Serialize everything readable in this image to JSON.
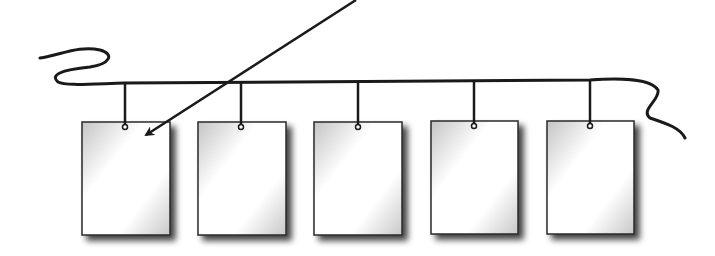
{
  "diagram": {
    "title": "",
    "colors": {
      "background": "#ffffff",
      "line": "#1a1a1a",
      "card_fill_light": "#ffffff",
      "card_fill_dark": "#c8c8c8",
      "shadow": "#555555"
    },
    "cards": [
      {
        "id": "card-1",
        "label": "",
        "x": 82,
        "y": 122,
        "w": 88,
        "h": 113,
        "hook_x": 125
      },
      {
        "id": "card-2",
        "label": "",
        "x": 198,
        "y": 122,
        "w": 88,
        "h": 113,
        "hook_x": 241
      },
      {
        "id": "card-3",
        "label": "",
        "x": 314,
        "y": 122,
        "w": 88,
        "h": 113,
        "hook_x": 358
      },
      {
        "id": "card-4",
        "label": "",
        "x": 431,
        "y": 121,
        "w": 87,
        "h": 113,
        "hook_x": 474
      },
      {
        "id": "card-5",
        "label": "",
        "x": 547,
        "y": 121,
        "w": 87,
        "h": 113,
        "hook_x": 590
      }
    ],
    "arrow": {
      "from": [
        356,
        0
      ],
      "to": [
        146,
        135
      ],
      "target": "card-1"
    }
  }
}
